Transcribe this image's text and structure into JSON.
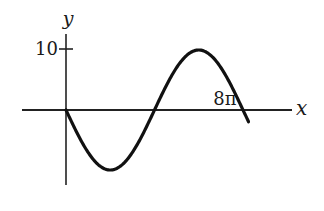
{
  "chart_data": {
    "type": "line",
    "title": "",
    "function": "y = -10 sin(x/4)",
    "xlabel": "x",
    "ylabel": "y",
    "xlim_units_of_pi": [
      -2,
      9.6
    ],
    "ylim": [
      -13,
      14.5
    ],
    "y_ticks": [
      {
        "value": 10,
        "label": "10"
      }
    ],
    "x_ticks": [
      {
        "value_units_of_pi": 8,
        "label": "8π"
      }
    ],
    "series": [
      {
        "name": "curve",
        "color": "#111111",
        "amplitude": 10,
        "period_units_of_pi": 8,
        "x_range_units_of_pi": [
          0,
          8.25
        ],
        "key_points": [
          {
            "x": "0",
            "y": 0
          },
          {
            "x": "2π",
            "y": -10
          },
          {
            "x": "4π",
            "y": 0
          },
          {
            "x": "6π",
            "y": 10
          },
          {
            "x": "8π",
            "y": 0
          }
        ]
      }
    ],
    "grid": false,
    "legend": "none"
  }
}
